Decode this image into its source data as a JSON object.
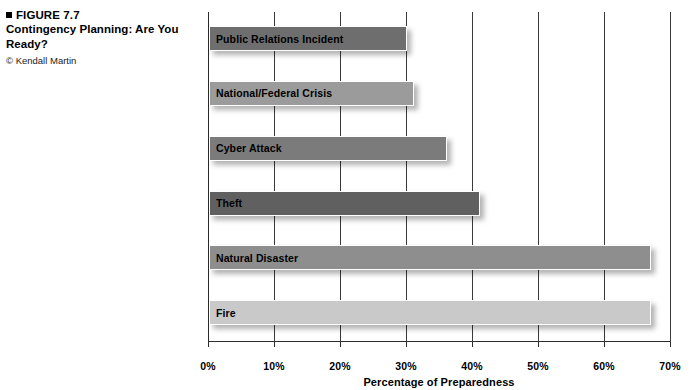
{
  "caption": {
    "figure_label": "FIGURE 7.7",
    "title": "Contingency Planning: Are You Ready?",
    "credit": "© Kendall Martin",
    "bullet_icon": "black-square-icon"
  },
  "chart_data": {
    "type": "bar",
    "orientation": "horizontal",
    "title": "Contingency Planning: Are You Ready?",
    "xlabel": "Percentage of Preparedness",
    "ylabel": "",
    "categories": [
      "Fire",
      "Natural Disaster",
      "Theft",
      "Cyber Attack",
      "National/Federal Crisis",
      "Public Relations Incident"
    ],
    "values": [
      67,
      67,
      41,
      36,
      31,
      30
    ],
    "bar_colors": [
      "#c9c9c9",
      "#8e8e8e",
      "#606060",
      "#7b7b7b",
      "#9b9b9b",
      "#6e6e6e"
    ],
    "xlim": [
      0,
      70
    ],
    "xticks": [
      0,
      10,
      20,
      30,
      40,
      50,
      60,
      70
    ],
    "xtick_labels": [
      "0%",
      "10%",
      "20%",
      "30%",
      "40%",
      "50%",
      "60%",
      "70%"
    ],
    "grid": true,
    "grid_axis": "x",
    "legend": false,
    "data_labels": false,
    "value_suffix": "%"
  }
}
